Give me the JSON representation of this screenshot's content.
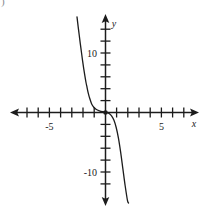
{
  "figure": {
    "corner_mark": ")",
    "background_color": "#ffffff",
    "ink_color": "#1c1c1c",
    "width": 203,
    "height": 210
  },
  "chart_data": {
    "type": "line",
    "title": "",
    "subtitle": "",
    "xlabel": "x",
    "ylabel": "y",
    "grid": false,
    "legend": null,
    "annotations": [],
    "axes": {
      "x": {
        "label": "x",
        "xlim": [
          -9.3,
          9.2
        ],
        "tick_step": 1,
        "labeled_ticks": [
          {
            "value": -5,
            "text": "-5"
          },
          {
            "value": 5,
            "text": "5"
          }
        ],
        "unlabeled_tick_values": [
          -8,
          -7,
          -6,
          -4,
          -3,
          -2,
          -1,
          1,
          2,
          3,
          4,
          6,
          7,
          8
        ],
        "arrow_both_ends": true,
        "pixel_origin": 105,
        "pixels_per_unit": 11.2
      },
      "y": {
        "label": "y",
        "ylim": [
          -15.5,
          16.2
        ],
        "tick_step": 2,
        "labeled_ticks": [
          {
            "value": 10,
            "text": "10"
          },
          {
            "value": -10,
            "text": "-10"
          }
        ],
        "unlabeled_tick_values": [
          14,
          12,
          8,
          6,
          4,
          2,
          -2,
          -4,
          -6,
          -8,
          -12,
          -14
        ],
        "arrow_both_ends": true,
        "pixel_origin": 112,
        "pixels_per_unit": 5.95
      }
    },
    "origin_marker": {
      "shown": true,
      "x": 0,
      "y": 0,
      "style": "filled-dot"
    },
    "series": [
      {
        "name": "curve",
        "description": "steeply decreasing curve with flat approach to x-axis on the left and near-vertical plunge on the right",
        "x": [
          -2.5,
          -2.4,
          -2.3,
          -2.2,
          -2.1,
          -2.0,
          -1.9,
          -1.8,
          -1.7,
          -1.6,
          -1.5,
          -1.4,
          -1.2,
          -1.0,
          -0.8,
          -0.5,
          -0.2,
          0.0,
          0.2,
          0.4,
          0.6,
          0.8,
          1.0,
          1.2,
          1.4,
          1.6,
          1.8,
          2.0,
          2.1
        ],
        "y": [
          16.0,
          14.4,
          12.9,
          11.4,
          10.0,
          8.6,
          7.3,
          6.1,
          5.0,
          4.1,
          3.2,
          2.5,
          1.4,
          0.8,
          0.45,
          0.2,
          0.05,
          0.0,
          -0.1,
          -0.3,
          -0.7,
          -1.4,
          -2.6,
          -4.4,
          -6.8,
          -9.6,
          -12.4,
          -14.8,
          -15.3
        ]
      }
    ]
  }
}
